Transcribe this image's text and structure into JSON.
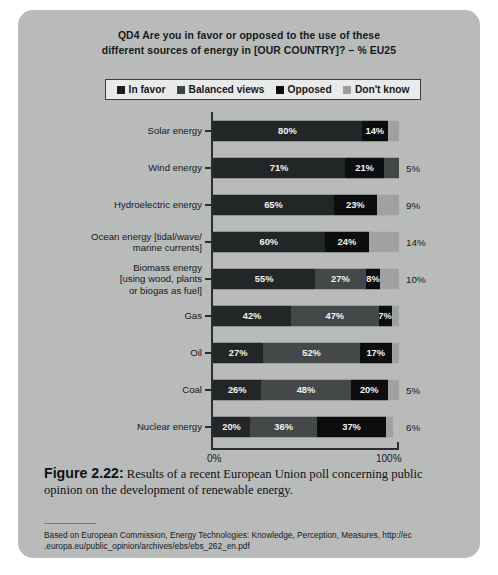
{
  "figure": {
    "chart_title": "QD4 Are you in favor or opposed to the use of these different sources of energy in [OUR COUNTRY]? – % EU25",
    "chart_title_line1": "QD4 Are you in favor or opposed to the use of these",
    "chart_title_line2": "different sources of energy in [OUR COUNTRY]? – % EU25",
    "caption_label": "Figure 2.22:",
    "caption_text": " Results of a recent European Union poll concerning public opinion on the development of renewable energy.",
    "source_line1": "Based on European Commission, Energy Technologies: Knowledge, Perception, Measures, http://ec",
    "source_line2": ".europa.eu/public_opinion/archives/ebs/ebs_262_en.pdf",
    "panel_color": "#b9bbbb"
  },
  "legend": {
    "items": [
      {
        "label": "In favor",
        "swatch": "legend-swatch-in-favor",
        "color": "#1b1c1d"
      },
      {
        "label": "Balanced views",
        "swatch": "legend-swatch-balanced-views",
        "color": "#3e4143"
      },
      {
        "label": "Opposed",
        "swatch": "legend-swatch-opposed",
        "color": "#0d0e0f"
      },
      {
        "label": "Don't know",
        "swatch": "legend-swatch-dont-know",
        "color": "#9b9d9e"
      }
    ]
  },
  "axis": {
    "min_label": "0%",
    "max_label": "100%"
  },
  "chart_data": {
    "type": "bar",
    "subtype": "stacked-horizontal-100pct",
    "title": "QD4 Are you in favor or opposed to the use of these different sources of energy in [OUR COUNTRY]? – % EU25",
    "xlabel": "",
    "ylabel": "",
    "xlim": [
      0,
      100
    ],
    "xticks": [
      0,
      100
    ],
    "xticklabels": [
      "0%",
      "100%"
    ],
    "grid": false,
    "legend_position": "top",
    "categories": [
      "Solar energy",
      "Wind energy",
      "Hydroelectric energy",
      "Ocean energy [tidal/wave/marine currents]",
      "Biomass energy [using wood, plants or biogas as fuel]",
      "Gas",
      "Oil",
      "Coal",
      "Nuclear energy"
    ],
    "series": [
      {
        "name": "In favor",
        "color": "#232627",
        "values": [
          80,
          71,
          65,
          60,
          55,
          42,
          27,
          26,
          20
        ]
      },
      {
        "name": "Balanced views",
        "color": "#454849",
        "values": [
          null,
          null,
          null,
          null,
          null,
          null,
          null,
          null,
          36
        ]
      },
      {
        "name": "Opposed",
        "color": "#0c0d0e",
        "values": [
          14,
          21,
          23,
          24,
          27,
          47,
          52,
          48,
          37
        ]
      },
      {
        "name": "Don't know",
        "color": "#9fa1a2",
        "values": [
          6,
          5,
          9,
          14,
          10,
          7,
          17,
          5,
          6
        ]
      }
    ],
    "rows": [
      {
        "label_lines": [
          "Solar energy"
        ],
        "outside_label": "",
        "segments": [
          {
            "series": "In favor",
            "value": 80,
            "label": "80%",
            "style": "seg-infavor"
          },
          {
            "series": "Opposed",
            "value": 14,
            "label": "14%",
            "style": "seg-opposed"
          },
          {
            "series": "Don't know",
            "value": 6,
            "label": "",
            "style": "seg-dontknow"
          }
        ]
      },
      {
        "label_lines": [
          "Wind energy"
        ],
        "outside_label": "5%",
        "segments": [
          {
            "series": "In favor",
            "value": 71,
            "label": "71%",
            "style": "seg-infavor"
          },
          {
            "series": "Opposed",
            "value": 21,
            "label": "21%",
            "style": "seg-opposed"
          },
          {
            "series": "Don't know",
            "value": 8,
            "label": "",
            "style": "seg-balanced"
          }
        ]
      },
      {
        "label_lines": [
          "Hydroelectric energy"
        ],
        "outside_label": "9%",
        "segments": [
          {
            "series": "In favor",
            "value": 65,
            "label": "65%",
            "style": "seg-infavor"
          },
          {
            "series": "Opposed",
            "value": 23,
            "label": "23%",
            "style": "seg-opposed"
          },
          {
            "series": "Don't know",
            "value": 12,
            "label": "",
            "style": "seg-dontknow"
          }
        ]
      },
      {
        "label_lines": [
          "Ocean energy [tidal/wave/",
          "marine currents]"
        ],
        "outside_label": "14%",
        "segments": [
          {
            "series": "In favor",
            "value": 60,
            "label": "60%",
            "style": "seg-infavor"
          },
          {
            "series": "Opposed",
            "value": 24,
            "label": "24%",
            "style": "seg-opposed"
          },
          {
            "series": "Don't know",
            "value": 16,
            "label": "",
            "style": "seg-dontknow"
          }
        ]
      },
      {
        "label_lines": [
          "Biomass energy",
          "[using wood, plants",
          "or biogas as fuel]"
        ],
        "outside_label": "10%",
        "segments": [
          {
            "series": "In favor",
            "value": 55,
            "label": "55%",
            "style": "seg-infavor"
          },
          {
            "series": "Opposed",
            "value": 27,
            "label": "27%",
            "style": "seg-balanced"
          },
          {
            "series": "Don't know",
            "value": 8,
            "label": "8%",
            "style": "seg-opposed"
          },
          {
            "series": "Don't know",
            "value": 10,
            "label": "",
            "style": "seg-dontknow"
          }
        ]
      },
      {
        "label_lines": [
          "Gas"
        ],
        "outside_label": "",
        "segments": [
          {
            "series": "In favor",
            "value": 42,
            "label": "42%",
            "style": "seg-infavor"
          },
          {
            "series": "Opposed",
            "value": 47,
            "label": "47%",
            "style": "seg-balanced"
          },
          {
            "series": "Don't know",
            "value": 7,
            "label": "7%",
            "style": "seg-opposed"
          },
          {
            "series": "Don't know",
            "value": 4,
            "label": "",
            "style": "seg-dontknow"
          }
        ]
      },
      {
        "label_lines": [
          "Oil"
        ],
        "outside_label": "",
        "segments": [
          {
            "series": "In favor",
            "value": 27,
            "label": "27%",
            "style": "seg-infavor"
          },
          {
            "series": "Opposed",
            "value": 52,
            "label": "52%",
            "style": "seg-balanced"
          },
          {
            "series": "Don't know",
            "value": 17,
            "label": "17%",
            "style": "seg-opposed"
          },
          {
            "series": "Don't know",
            "value": 4,
            "label": "",
            "style": "seg-dontknow"
          }
        ]
      },
      {
        "label_lines": [
          "Coal"
        ],
        "outside_label": "5%",
        "segments": [
          {
            "series": "In favor",
            "value": 26,
            "label": "26%",
            "style": "seg-infavor"
          },
          {
            "series": "Opposed",
            "value": 48,
            "label": "48%",
            "style": "seg-balanced"
          },
          {
            "series": "Don't know",
            "value": 20,
            "label": "20%",
            "style": "seg-opposed"
          },
          {
            "series": "Don't know",
            "value": 6,
            "label": "",
            "style": "seg-dontknow"
          }
        ]
      },
      {
        "label_lines": [
          "Nuclear energy"
        ],
        "outside_label": "6%",
        "segments": [
          {
            "series": "In favor",
            "value": 20,
            "label": "20%",
            "style": "seg-infavor"
          },
          {
            "series": "Balanced views",
            "value": 36,
            "label": "36%",
            "style": "seg-balanced"
          },
          {
            "series": "Opposed",
            "value": 37,
            "label": "37%",
            "style": "seg-opposed"
          },
          {
            "series": "Don't know",
            "value": 4,
            "label": "",
            "style": "seg-dontknow"
          }
        ]
      }
    ]
  }
}
